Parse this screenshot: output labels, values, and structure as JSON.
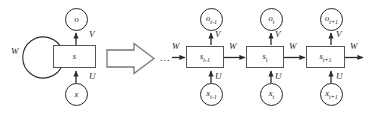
{
  "figure": {
    "stroke_color": "#2a2a2a",
    "box_stroke_color": "#555555",
    "background_color": "#ffffff"
  },
  "folded": {
    "output_node": {
      "label": "o",
      "name": "output-node"
    },
    "state_node": {
      "label": "s",
      "name": "state-node"
    },
    "input_node": {
      "label": "x",
      "name": "input-node"
    },
    "weight_V": "V",
    "weight_U": "U",
    "weight_W": "W"
  },
  "transform_arrow": {
    "name": "unfold-arrow",
    "label": ""
  },
  "unfolded": {
    "ellipsis": "...",
    "leading_weight": "W",
    "trailing_weight": "W",
    "steps": [
      {
        "output": "o",
        "output_sub": "t-1",
        "state": "s",
        "state_sub": "t-1",
        "input": "x",
        "input_sub": "t-1",
        "weight_V": "V",
        "weight_U": "U",
        "weight_W_out": "W"
      },
      {
        "output": "o",
        "output_sub": "t",
        "state": "s",
        "state_sub": "t",
        "input": "x",
        "input_sub": "t",
        "weight_V": "V",
        "weight_U": "U",
        "weight_W_out": "W"
      },
      {
        "output": "o",
        "output_sub": "t+1",
        "state": "s",
        "state_sub": "t+1",
        "input": "x",
        "input_sub": "t+1",
        "weight_V": "V",
        "weight_U": "U",
        "weight_W_out": "W"
      }
    ]
  }
}
